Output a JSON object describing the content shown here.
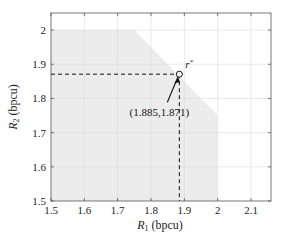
{
  "chart_data": {
    "type": "area",
    "title": "",
    "xlabel": "R_1 (bpcu)",
    "ylabel": "R_2 (bpcu)",
    "xlabel_main": "R",
    "xlabel_sub": "1",
    "xlabel_unit": " (bpcu)",
    "ylabel_main": "R",
    "ylabel_sub": "2",
    "ylabel_unit": " (bpcu)",
    "xlim": [
      1.5,
      2.16
    ],
    "ylim": [
      1.5,
      2.05
    ],
    "xticks": [
      1.5,
      1.6,
      1.7,
      1.8,
      1.9,
      2,
      2.1
    ],
    "xtick_labels": [
      "1.5",
      "1.6",
      "1.7",
      "1.8",
      "1.9",
      "2",
      "2.1"
    ],
    "yticks": [
      1.5,
      1.6,
      1.7,
      1.8,
      1.9,
      2
    ],
    "ytick_labels": [
      "1.5",
      "1.6",
      "1.7",
      "1.8",
      "1.9",
      "2"
    ],
    "grid": true,
    "region": {
      "name": "achievable rate region",
      "fill": "#ececec",
      "polygon": [
        [
          1.5,
          1.5
        ],
        [
          1.5,
          2.0
        ],
        [
          1.75,
          2.0
        ],
        [
          2.0,
          1.75
        ],
        [
          2.0,
          1.5
        ]
      ]
    },
    "point": {
      "label": "r*",
      "x": 1.885,
      "y": 1.871,
      "annotation": "(1.885,1.871)"
    }
  }
}
